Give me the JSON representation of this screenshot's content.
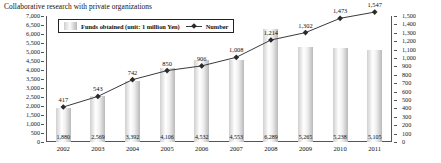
{
  "title": "Collaborative research with private organizations",
  "legend": {
    "bars_label": "Funds obtained (unit: 1 million Yen)",
    "line_label": "Number",
    "bars_icon": "bar-swatch-icon",
    "line_icon": "line-marker-icon"
  },
  "chart_data": {
    "type": "bar",
    "title": "Collaborative research with private organizations",
    "xlabel": "",
    "ylabel": "",
    "categories": [
      "2002",
      "2003",
      "2004",
      "2005",
      "2006",
      "2007",
      "2008",
      "2009",
      "2010",
      "2011"
    ],
    "series": [
      {
        "name": "Funds obtained (unit: 1 million Yen)",
        "type": "bar",
        "axis": "left",
        "values": [
          1880,
          2569,
          3392,
          4106,
          4532,
          4553,
          6289,
          5265,
          5238,
          5105
        ],
        "labels": [
          "1,880",
          "2,569",
          "3,392",
          "4,106",
          "4,532",
          "4,553",
          "6,289",
          "5,265",
          "5,238",
          "5,105"
        ]
      },
      {
        "name": "Number",
        "type": "line",
        "axis": "right",
        "values": [
          417,
          543,
          742,
          850,
          906,
          1008,
          1214,
          1302,
          1473,
          1547
        ],
        "labels": [
          "417",
          "543",
          "742",
          "850",
          "906",
          "1,008",
          "1,214",
          "1,302",
          "1,473",
          "1,547"
        ]
      }
    ],
    "left_axis": {
      "min": 0,
      "max": 7000,
      "step": 500,
      "ticks": [
        "7,000",
        "6,500",
        "6,000",
        "5,500",
        "5,000",
        "4,500",
        "4,000",
        "3,500",
        "3,000",
        "2,500",
        "2,000",
        "1,500",
        "1,000",
        "500",
        "0"
      ]
    },
    "right_axis": {
      "min": 0,
      "max": 1500,
      "step": 100,
      "ticks": [
        "1,500",
        "1,400",
        "1,300",
        "1,200",
        "1,100",
        "1,000",
        "900",
        "800",
        "700",
        "600",
        "500",
        "400",
        "300",
        "200",
        "100",
        "0"
      ]
    },
    "grid": false,
    "legend_position": "top-left-inside",
    "colors": {
      "bar_light": "#e9e9e9",
      "bar_dark": "#b9b9b9",
      "line": "#3a3a3a",
      "marker": "#2b2b2b",
      "axis": "#555555",
      "text": "#111111"
    }
  }
}
